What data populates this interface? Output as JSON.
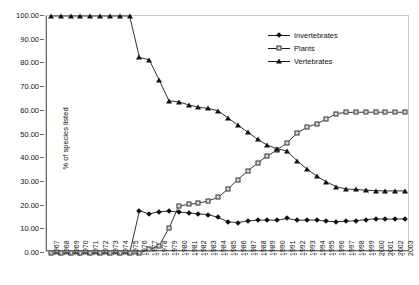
{
  "chart_data": {
    "type": "line",
    "title": "",
    "xlabel": "",
    "ylabel": "% of species listed",
    "ylim": [
      0,
      100
    ],
    "ytick_labels": [
      "100.00",
      "90.00",
      "80.00",
      "70.00",
      "60.00",
      "50.00",
      "40.00",
      "30.00",
      "20.00",
      "10.00",
      "0.00"
    ],
    "ytick_values": [
      100,
      90,
      80,
      70,
      60,
      50,
      40,
      30,
      20,
      10,
      0
    ],
    "grid": false,
    "legend_position": "top-right",
    "categories": [
      "1967",
      "1968",
      "1969",
      "1970",
      "1971",
      "1972",
      "1973",
      "1974",
      "1975",
      "1976",
      "1977",
      "1978",
      "1979",
      "1980",
      "1981",
      "1982",
      "1983",
      "1984",
      "1985",
      "1986",
      "1987",
      "1988",
      "1989",
      "1990",
      "1991",
      "1992",
      "1993",
      "1994",
      "1995",
      "1996",
      "1997",
      "1998",
      "1999",
      "2000",
      "2001",
      "2002",
      "2003"
    ],
    "series": [
      {
        "name": "Invertebrates",
        "marker": "filled-diamond",
        "values": [
          0,
          0,
          0,
          0,
          0,
          0,
          0,
          0,
          0,
          17.8,
          16.5,
          17.5,
          17.6,
          17.3,
          16.9,
          16.5,
          16.2,
          15.0,
          13.2,
          12.8,
          13.6,
          13.8,
          13.9,
          13.8,
          14.6,
          13.8,
          13.9,
          13.9,
          13.4,
          13.2,
          13.4,
          13.6,
          14.1,
          14.4,
          14.3,
          14.3,
          14.4
        ]
      },
      {
        "name": "Plants",
        "marker": "open-square",
        "values": [
          0,
          0,
          0,
          0,
          0,
          0,
          0,
          0,
          0,
          0,
          1.5,
          3.0,
          10.5,
          19.8,
          20.5,
          21.0,
          22.0,
          23.5,
          27.0,
          31.0,
          34.5,
          38.0,
          41.0,
          43.5,
          46.5,
          50.5,
          53.0,
          54.5,
          56.5,
          58.8,
          59.3,
          59.4,
          59.4,
          59.4,
          59.4,
          59.4,
          59.4
        ]
      },
      {
        "name": "Vertebrates",
        "marker": "filled-triangle",
        "values": [
          100,
          100,
          100,
          100,
          100,
          100,
          100,
          100,
          100,
          82.5,
          81.5,
          73.0,
          64.2,
          63.8,
          62.5,
          61.5,
          61.0,
          60.0,
          57.0,
          54.0,
          51.0,
          48.0,
          45.5,
          44.0,
          43.0,
          39.0,
          35.5,
          32.5,
          30.0,
          28.0,
          27.0,
          26.8,
          26.5,
          26.3,
          26.2,
          26.2,
          26.2
        ]
      }
    ]
  }
}
